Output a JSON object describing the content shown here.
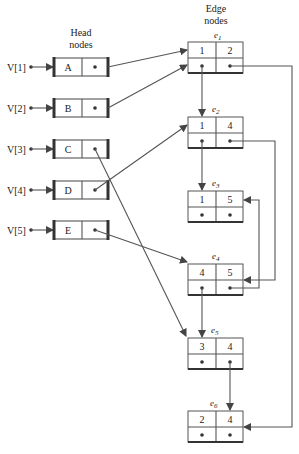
{
  "diagram": {
    "type": "adjacency-multilist",
    "head_title_line1": "Head",
    "head_title_line2": "nodes",
    "edge_title_line1": "Edge",
    "edge_title_line2": "nodes",
    "vertices": [
      {
        "label": "V[1]",
        "node": "A"
      },
      {
        "label": "V[2]",
        "node": "B"
      },
      {
        "label": "V[3]",
        "node": "C"
      },
      {
        "label": "V[4]",
        "node": "D"
      },
      {
        "label": "V[5]",
        "node": "E"
      }
    ],
    "edges": [
      {
        "name": "e",
        "sub": "1",
        "v1": "1",
        "v2": "2"
      },
      {
        "name": "e",
        "sub": "2",
        "v1": "1",
        "v2": "4"
      },
      {
        "name": "e",
        "sub": "3",
        "v1": "1",
        "v2": "5"
      },
      {
        "name": "e",
        "sub": "4",
        "v1": "4",
        "v2": "5"
      },
      {
        "name": "e",
        "sub": "5",
        "v1": "3",
        "v2": "4"
      },
      {
        "name": "e",
        "sub": "6",
        "v1": "2",
        "v2": "4"
      }
    ],
    "links": [
      {
        "from": "A",
        "to": "e1"
      },
      {
        "from": "B",
        "to": "e1"
      },
      {
        "from": "C",
        "to": "e5"
      },
      {
        "from": "D",
        "to": "e2"
      },
      {
        "from": "E",
        "to": "e4"
      },
      {
        "from": "e1.link1",
        "to": "e2"
      },
      {
        "from": "e1.link2",
        "to": "e6"
      },
      {
        "from": "e2.link1",
        "to": "e3"
      },
      {
        "from": "e2.link2",
        "to": "e4"
      },
      {
        "from": "e4.link1",
        "to": "e5"
      },
      {
        "from": "e4.link2",
        "to": "e3"
      },
      {
        "from": "e5.link2",
        "to": "e6"
      }
    ],
    "colors": {
      "line": "#555555",
      "text": "#222222",
      "background": "#ffffff"
    }
  }
}
